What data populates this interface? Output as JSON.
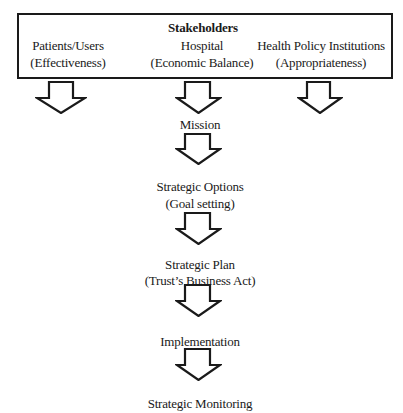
{
  "diagram": {
    "stakeholders_box": {
      "title": "Stakeholders",
      "columns": [
        {
          "name": "Patients/Users",
          "criterion": "(Effectiveness)"
        },
        {
          "name": "Hospital",
          "criterion": "(Economic Balance)"
        },
        {
          "name": "Health Policy Institutions",
          "criterion": "(Appropriateness)"
        }
      ]
    },
    "flow": [
      {
        "lines": [
          "Mission"
        ]
      },
      {
        "lines": [
          "Strategic Options",
          "(Goal setting)"
        ]
      },
      {
        "lines": [
          "Strategic Plan",
          "(Trust’s Business Act)"
        ]
      },
      {
        "lines": [
          "Implementation"
        ]
      },
      {
        "lines": [
          "Strategic Monitoring"
        ]
      }
    ],
    "arrow_icon": "hollow-down-arrow",
    "colors": {
      "stroke": "#1a1a1a",
      "background": "#ffffff"
    }
  }
}
